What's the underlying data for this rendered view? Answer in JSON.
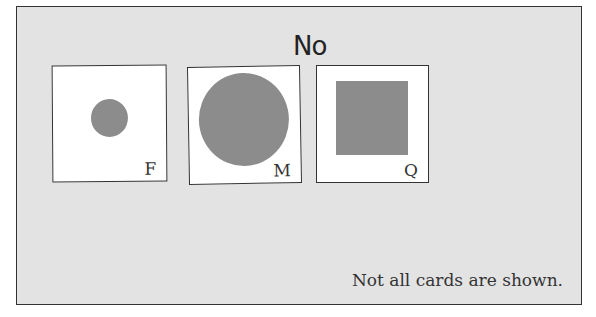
{
  "heading": "No",
  "cards": [
    {
      "label": "F",
      "shape": "small-circle"
    },
    {
      "label": "M",
      "shape": "large-circle"
    },
    {
      "label": "Q",
      "shape": "square"
    }
  ],
  "note": "Not all cards are shown.",
  "colors": {
    "panel": "#e3e3e3",
    "card": "#ffffff",
    "shape": "#8c8c8c",
    "border": "#333333"
  }
}
